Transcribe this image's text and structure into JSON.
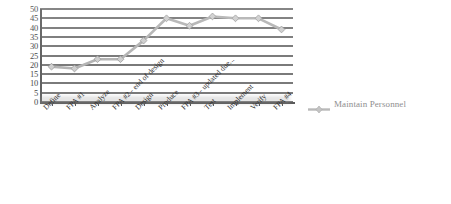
{
  "chart_data": {
    "type": "line",
    "title": "",
    "xlabel": "",
    "ylabel": "",
    "ylim": [
      0,
      50
    ],
    "ytick_step": 5,
    "yticks": [
      50,
      45,
      40,
      35,
      30,
      25,
      20,
      15,
      10,
      5,
      0
    ],
    "grid": true,
    "grid_axis": "y",
    "legend_position": "right",
    "categories": [
      "Define",
      "FPA #1",
      "Analyze",
      "FPA #2 - end of design",
      "Design",
      "Produce",
      "FPA #3 - updated due...",
      "Test",
      "Implement",
      "Verify",
      "FPA #4"
    ],
    "series": [
      {
        "name": "Maintain Personnel",
        "marker": "diamond",
        "color": "#b4b4b4",
        "values": [
          19,
          18,
          23,
          23,
          33,
          45,
          41,
          46,
          45,
          45,
          39
        ]
      }
    ]
  },
  "legend": {
    "entries": [
      {
        "label": "Maintain Personnel",
        "marker": "diamond-line-marker"
      }
    ]
  },
  "colors": {
    "grid": "#6f6f6f",
    "axis": "#5a5a5a",
    "series": "#b4b4b4",
    "marker_edge": "#9a9a9a",
    "tick_text": "#3a3a3a",
    "legend_text": "#8e8e8e",
    "background": "#ffffff"
  }
}
